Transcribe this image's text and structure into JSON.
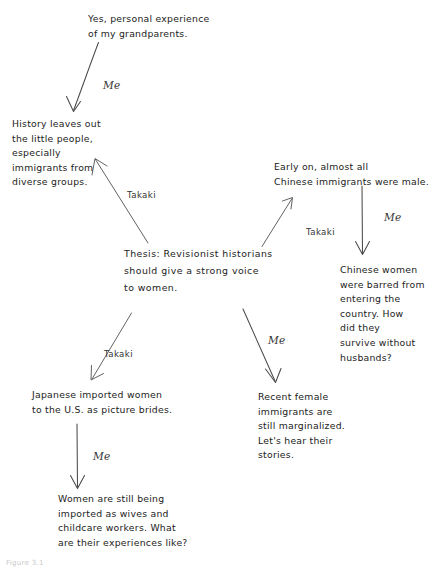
{
  "diagram": {
    "type": "concept-map",
    "background_color": "#ffffff",
    "ink_color": "#222222",
    "nodes": [
      {
        "id": "grandparents",
        "label": "Yes, personal experience\nof my grandparents.",
        "x": 88,
        "y": 12,
        "width": 175,
        "align": "left"
      },
      {
        "id": "history-leaves-out",
        "label": "History leaves out\nthe little people,\nespecially\nimmigrants from\ndiverse groups.",
        "x": 12,
        "y": 117,
        "width": 120,
        "align": "left"
      },
      {
        "id": "early-on-chinese",
        "label": "Early on, almost all\nChinese immigrants were male.",
        "x": 274,
        "y": 160,
        "width": 165,
        "align": "left"
      },
      {
        "id": "thesis",
        "label": "Thesis:  Revisionist historians\nshould  give  a  strong  voice\nto  women.",
        "x": 124,
        "y": 245,
        "width": 200,
        "align": "left"
      },
      {
        "id": "chinese-women-barred",
        "label": "Chinese women\nwere barred from\nentering the\ncountry. How\ndid they\nsurvive without\nhusbands?",
        "x": 340,
        "y": 263,
        "width": 98,
        "align": "left"
      },
      {
        "id": "japanese-picture-brides",
        "label": "Japanese imported women\n   to the U.S. as picture brides.",
        "x": 32,
        "y": 388,
        "width": 190,
        "align": "left"
      },
      {
        "id": "recent-female-immigrants",
        "label": "Recent female\nimmigrants are\nstill marginalized.\nLet's hear their\nstories.",
        "x": 258,
        "y": 390,
        "width": 115,
        "align": "left"
      },
      {
        "id": "women-still-imported",
        "label": "Women are still being\nimported as wives and\nchildcare workers. What\nare their experiences like?",
        "x": 58,
        "y": 492,
        "width": 190,
        "align": "left"
      }
    ],
    "edges": [
      {
        "id": "grandparents-to-history",
        "label": "Me",
        "label_x": 103,
        "label_y": 79,
        "from": {
          "x": 98,
          "y": 43
        },
        "to": {
          "x": 73,
          "y": 111
        },
        "style": "me"
      },
      {
        "id": "thesis-to-history",
        "label": "Takaki",
        "label_x": 127,
        "label_y": 190,
        "from": {
          "x": 148,
          "y": 243
        },
        "to": {
          "x": 95,
          "y": 159
        },
        "style": "takaki"
      },
      {
        "id": "thesis-to-early-on",
        "label": "Takaki",
        "label_x": 306,
        "label_y": 227,
        "from": {
          "x": 262,
          "y": 246
        },
        "to": {
          "x": 292,
          "y": 199
        },
        "style": "takaki"
      },
      {
        "id": "early-on-to-chinese-women",
        "label": "Me",
        "label_x": 384,
        "label_y": 211,
        "from": {
          "x": 362,
          "y": 186
        },
        "to": {
          "x": 362,
          "y": 253
        },
        "style": "me"
      },
      {
        "id": "thesis-to-japanese",
        "label": "Takaki",
        "label_x": 104,
        "label_y": 349,
        "from": {
          "x": 131,
          "y": 313
        },
        "to": {
          "x": 92,
          "y": 379
        },
        "style": "takaki"
      },
      {
        "id": "thesis-to-recent-female",
        "label": "Me",
        "label_x": 268,
        "label_y": 334,
        "from": {
          "x": 243,
          "y": 309
        },
        "to": {
          "x": 275,
          "y": 381
        },
        "style": "me"
      },
      {
        "id": "japanese-to-women-still",
        "label": "Me",
        "label_x": 93,
        "label_y": 450,
        "from": {
          "x": 77,
          "y": 424
        },
        "to": {
          "x": 77,
          "y": 487
        },
        "style": "me"
      }
    ],
    "caption": "Figure 3.1"
  }
}
